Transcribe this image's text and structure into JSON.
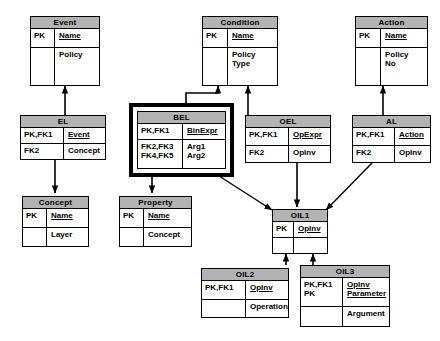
{
  "diagram": {
    "background": "#ffffff",
    "header_fill": "#b3b3b3",
    "line_color": "#000000",
    "highlight_color": "#000000"
  },
  "entities": {
    "event": {
      "name": "Event",
      "rows": [
        {
          "key": "PK",
          "attr": "Name",
          "pk": true
        },
        {
          "key": "",
          "attr": "Policy",
          "pk": false
        }
      ]
    },
    "condition": {
      "name": "Condition",
      "rows": [
        {
          "key": "PK",
          "attr": "Name",
          "pk": true
        },
        {
          "key": "",
          "attr": "Policy\nType",
          "pk": false
        }
      ]
    },
    "action": {
      "name": "Action",
      "rows": [
        {
          "key": "PK",
          "attr": "Name",
          "pk": true
        },
        {
          "key": "",
          "attr": "Policy\nNo",
          "pk": false
        }
      ]
    },
    "el": {
      "name": "EL",
      "rows": [
        {
          "key": "PK,FK1",
          "attr": "Event",
          "pk": true
        },
        {
          "key": "FK2",
          "attr": "Concept",
          "pk": false
        }
      ]
    },
    "bel": {
      "name": "BEL",
      "highlighted": true,
      "rows": [
        {
          "key": "PK,FK1",
          "attr": "BinExpr",
          "pk": true
        },
        {
          "key": "FK2,FK3\nFK4,FK5",
          "attr": "Arg1\nArg2",
          "pk": false
        }
      ]
    },
    "oel": {
      "name": "OEL",
      "rows": [
        {
          "key": "PK,FK1",
          "attr": "OpExpr",
          "pk": true
        },
        {
          "key": "FK2",
          "attr": "OpInv",
          "pk": false
        }
      ]
    },
    "al": {
      "name": "AL",
      "rows": [
        {
          "key": "PK,FK1",
          "attr": "Action",
          "pk": true
        },
        {
          "key": "FK2",
          "attr": "OpInv",
          "pk": false
        }
      ]
    },
    "concept": {
      "name": "Concept",
      "rows": [
        {
          "key": "PK",
          "attr": "Name",
          "pk": true
        },
        {
          "key": "",
          "attr": "Layer",
          "pk": false
        }
      ]
    },
    "property": {
      "name": "Property",
      "rows": [
        {
          "key": "PK",
          "attr": "Name",
          "pk": true
        },
        {
          "key": "",
          "attr": "Concept",
          "pk": false
        }
      ]
    },
    "oil1": {
      "name": "OIL1",
      "rows": [
        {
          "key": "PK",
          "attr": "OpInv",
          "pk": true
        },
        {
          "key": "",
          "attr": "",
          "pk": false
        }
      ]
    },
    "oil2": {
      "name": "OIL2",
      "rows": [
        {
          "key": "PK,FK1",
          "attr": "OpInv",
          "pk": true
        },
        {
          "key": "",
          "attr": "Operation",
          "pk": false
        }
      ]
    },
    "oil3": {
      "name": "OIL3",
      "rows": [
        {
          "key": "PK,FK1\nPK",
          "attr": "OpInv\nParameter",
          "pk": true
        },
        {
          "key": "",
          "attr": "Argument",
          "pk": false
        }
      ]
    }
  },
  "relationships": [
    {
      "from": "el",
      "to": "event",
      "type": "identifying"
    },
    {
      "from": "bel",
      "to": "condition",
      "type": "identifying"
    },
    {
      "from": "oel",
      "to": "condition",
      "type": "identifying"
    },
    {
      "from": "al",
      "to": "action",
      "type": "identifying"
    },
    {
      "from": "el",
      "to": "concept",
      "type": "non-identifying"
    },
    {
      "from": "bel",
      "to": "property",
      "type": "non-identifying"
    },
    {
      "from": "bel",
      "to": "oil1",
      "type": "non-identifying"
    },
    {
      "from": "oel",
      "to": "oil1",
      "type": "non-identifying"
    },
    {
      "from": "al",
      "to": "oil1",
      "type": "non-identifying"
    },
    {
      "from": "oil2",
      "to": "oil1",
      "type": "identifying"
    },
    {
      "from": "oil3",
      "to": "oil1",
      "type": "identifying"
    }
  ]
}
